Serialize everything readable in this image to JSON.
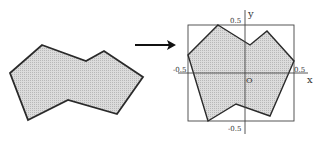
{
  "diagram": {
    "source_shape": {
      "points": "42,45 86,61 104,51 143,77 117,114 68,100 28,120 10,73",
      "fill": "#d4d4d4",
      "stroke": "#2a2a2a"
    },
    "arrow": {
      "x1": 135,
      "y1": 45,
      "x2": 175,
      "y2": 45,
      "color": "#111111"
    },
    "normalized_shape": {
      "points": "218,25 250,45 267,31 294,61 270,116 236,104 208,121 188,55",
      "fill": "#d4d4d4",
      "stroke": "#2a2a2a"
    },
    "bounding_box": {
      "x": 188,
      "y": 25,
      "width": 106,
      "height": 96
    },
    "axes": {
      "x_label": "x",
      "y_label": "y",
      "origin_label": "O",
      "tick_labels": {
        "x_neg": "-0.5",
        "x_pos": "0.5",
        "y_pos": "0.5",
        "y_neg": "-0.5"
      }
    }
  }
}
